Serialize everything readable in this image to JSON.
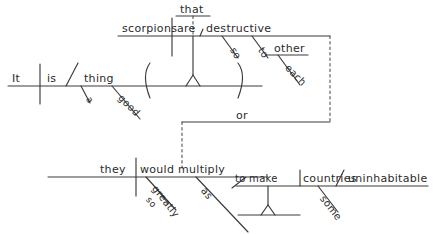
{
  "diagram": {
    "type": "reed-kellogg-sentence-diagram",
    "sentence": "It is a good thing that scorpions are destructive so to each other or they would multiply greatly so as to make some countries uninhabitable",
    "background_color": "#ffffff",
    "ink_color": "#3a3a3a",
    "main_clause": {
      "subject": "It",
      "verb": "is",
      "predicate_noun": "thing",
      "modifiers": [
        {
          "label": "a",
          "attaches_to": "thing"
        },
        {
          "label": "good",
          "attaches_to": "thing"
        }
      ]
    },
    "appositive_clause": {
      "introducer": "that",
      "subject": "scorpions",
      "verb": "are",
      "predicate_adjective": "destructive",
      "modifiers": [
        {
          "label": "so",
          "attaches_to": "destructive"
        },
        {
          "label": "to",
          "attaches_to": "destructive"
        },
        {
          "label": "other",
          "attaches_to": "to"
        },
        {
          "label": "each",
          "attaches_to": "other"
        }
      ]
    },
    "conjunction": "or",
    "second_clause": {
      "subject": "they",
      "verb": "would multiply",
      "verb_words": [
        "would",
        "multiply"
      ],
      "modifiers": [
        {
          "label": "greatly",
          "attaches_to": "multiply"
        },
        {
          "label": "so",
          "attaches_to": "greatly"
        },
        {
          "label": "as",
          "attaches_to": "multiply"
        }
      ],
      "infinitive_phrase": {
        "infinitive": "to make",
        "object": "countries",
        "object_complement": "uninhabitable",
        "modifiers": [
          {
            "label": "some",
            "attaches_to": "countries"
          }
        ]
      }
    },
    "labels": {
      "it": "It",
      "is": "is",
      "a": "a",
      "good": "good",
      "thing": "thing",
      "that": "that",
      "scorpions": "scorpions",
      "are": "are",
      "destructive": "destructive",
      "so_upper": "so",
      "to_upper": "to",
      "other": "other",
      "each": "each",
      "or": "or",
      "they": "they",
      "would": "would",
      "multiply": "multiply",
      "greatly": "greatly",
      "so_lower": "so",
      "as": "as",
      "to_make": "to make",
      "countries": "countries",
      "uninhabitable": "uninhabitable",
      "some": "some"
    }
  }
}
